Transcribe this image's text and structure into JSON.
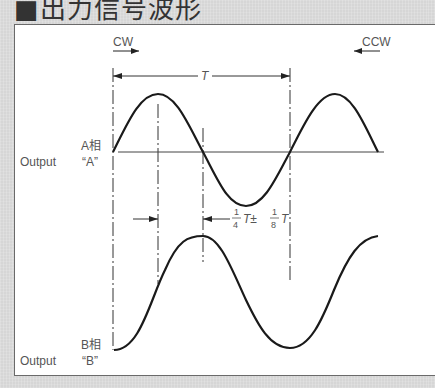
{
  "title": "■出力信号波形",
  "direction": {
    "cw_label": "CW",
    "ccw_label": "CCW"
  },
  "period": {
    "label": "T"
  },
  "phase_offset": {
    "num1": "1",
    "den1": "4",
    "mid": "T±",
    "num2": "1",
    "den2": "8",
    "tail": "T"
  },
  "signals": [
    {
      "name": "A相",
      "output_label": "Output",
      "output_name": "“A”",
      "waveform": "sine",
      "phase": "leading"
    },
    {
      "name": "B相",
      "output_label": "Output",
      "output_name": "“B”",
      "waveform": "sine",
      "phase": "lagging by 1/4 T"
    }
  ],
  "colors": {
    "background": "#d6d6d6",
    "panel": "#ffffff",
    "line": "#1a1a1a",
    "text": "#555555"
  }
}
